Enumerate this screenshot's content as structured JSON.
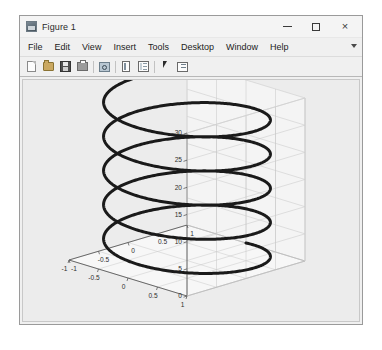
{
  "window": {
    "title": "Figure 1",
    "icon": "matlab-figure-icon",
    "controls": {
      "minimize": "–",
      "maximize": "□",
      "close": "×"
    }
  },
  "menubar": {
    "items": [
      {
        "label": "File"
      },
      {
        "label": "Edit"
      },
      {
        "label": "View"
      },
      {
        "label": "Insert"
      },
      {
        "label": "Tools"
      },
      {
        "label": "Desktop"
      },
      {
        "label": "Window"
      },
      {
        "label": "Help"
      }
    ],
    "overflow": "menu-overflow-arrow"
  },
  "toolbar": {
    "buttons": [
      {
        "name": "new-figure-button",
        "icon": "new-page-icon"
      },
      {
        "name": "open-file-button",
        "icon": "open-folder-icon"
      },
      {
        "name": "save-figure-button",
        "icon": "floppy-disk-icon"
      },
      {
        "name": "print-figure-button",
        "icon": "printer-icon"
      },
      {
        "name": "zoom-in-button",
        "icon": "magnifier-icon"
      },
      {
        "name": "insert-colorbar-button",
        "icon": "colorbar-panel-icon"
      },
      {
        "name": "insert-legend-button",
        "icon": "legend-panel-icon"
      },
      {
        "name": "edit-plot-button",
        "icon": "arrow-cursor-icon"
      },
      {
        "name": "show-plot-tools-button",
        "icon": "plot-tools-icon"
      }
    ]
  },
  "chart_data": {
    "type": "line",
    "render": "3d-helix",
    "title": "",
    "xlabel": "",
    "ylabel": "",
    "zlabel": "",
    "grid": true,
    "legend": null,
    "line_color": "#1a1a1a",
    "line_width": 3,
    "xlim": [
      -1,
      1
    ],
    "ylim": [
      -1,
      1
    ],
    "zlim": [
      0,
      30
    ],
    "xticks": [
      -1,
      -0.5,
      0,
      0.5,
      1
    ],
    "yticks": [
      -1,
      -0.5,
      0,
      0.5,
      1
    ],
    "zticks": [
      0,
      5,
      10,
      15,
      20,
      25,
      30
    ],
    "xticklabels": [
      "-1",
      "-0.5",
      "0",
      "0.5",
      "1"
    ],
    "yticklabels": [
      "-1",
      "-0.5",
      "0",
      "0.5",
      "1"
    ],
    "zticklabels": [
      "0",
      "5",
      "10",
      "15",
      "20",
      "25",
      "30"
    ],
    "parametric": {
      "x": "cos(t)",
      "y": "sin(t)",
      "z": "t",
      "t_range": [
        0,
        30
      ],
      "turns": 4.77
    },
    "view": {
      "azimuth": -37.5,
      "elevation": 30
    }
  }
}
